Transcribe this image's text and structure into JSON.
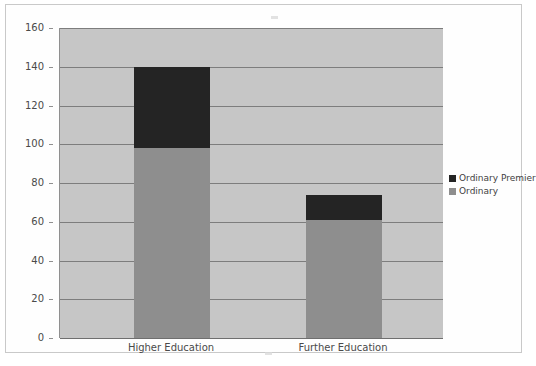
{
  "figure": {
    "border_color": "#c9c9c9",
    "plot_background": "#c6c6c6"
  },
  "legend": {
    "position": "right",
    "items": [
      {
        "label": "Ordinary Premier",
        "color": "#242424",
        "swatch_name": "legend-swatch-ordinary-premier"
      },
      {
        "label": "Ordinary",
        "color": "#8e8e8e",
        "swatch_name": "legend-swatch-ordinary"
      }
    ]
  },
  "chart_data": {
    "type": "bar",
    "subtype": "stacked",
    "title": "",
    "xlabel": "",
    "ylabel": "",
    "categories": [
      "Higher Education",
      "Further Education"
    ],
    "series": [
      {
        "name": "Ordinary",
        "color": "#8e8e8e",
        "values": [
          98,
          61
        ]
      },
      {
        "name": "Ordinary Premier",
        "color": "#242424",
        "values": [
          42,
          13
        ]
      }
    ],
    "totals": [
      140,
      74
    ],
    "ylim": [
      0,
      160
    ],
    "ytick_step": 20,
    "yticks": [
      0,
      20,
      40,
      60,
      80,
      100,
      120,
      140,
      160
    ],
    "ytick_labels": [
      "0",
      "20",
      "40",
      "60",
      "80",
      "100",
      "120",
      "140",
      "160"
    ],
    "grid": true,
    "grid_axis": "y",
    "legend_position": "right"
  }
}
